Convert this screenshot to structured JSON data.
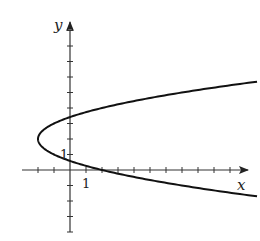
{
  "figure": {
    "type": "graph",
    "equation": "x = (y-2)^2 - 2",
    "axes": {
      "x_label": "x",
      "y_label": "y",
      "x_tick_label": "1",
      "y_tick_label": "1",
      "origin_px": [
        70,
        170
      ],
      "x_unit_px": 16,
      "y_unit_px": 15.5,
      "x_ticks": [
        -2,
        -1,
        1,
        2,
        3,
        4,
        5,
        6,
        7,
        8,
        9,
        10
      ],
      "y_ticks": [
        -4,
        -3,
        -2,
        -1,
        1,
        2,
        3,
        4,
        5,
        6,
        7,
        8,
        9
      ]
    },
    "curve": {
      "vertex": [
        -2,
        2
      ],
      "y_range": [
        -1.7,
        5.7
      ],
      "color": "#111111"
    }
  }
}
